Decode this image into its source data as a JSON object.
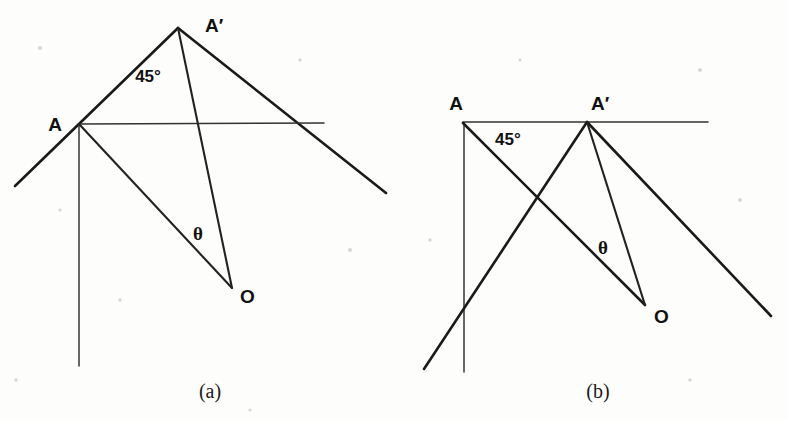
{
  "figure": {
    "background_color": "#fdfdfb",
    "ink_color": "#1a1a1a",
    "width": 788,
    "height": 421
  },
  "panels": [
    {
      "id": "panel-a",
      "caption": "(a)",
      "caption_pos": {
        "x": 210,
        "y": 398
      },
      "labels": {
        "vertex_a": "A",
        "vertex_a_prime": "A′",
        "vertex_o": "O",
        "angle_45": "45°",
        "angle_theta": "θ"
      },
      "label_positions": {
        "vertex_a": {
          "x": 55,
          "y": 131
        },
        "vertex_a_prime": {
          "x": 205,
          "y": 32
        },
        "vertex_o": {
          "x": 240,
          "y": 303
        },
        "angle_45": {
          "x": 148,
          "y": 82
        },
        "angle_theta": {
          "x": 198,
          "y": 240
        }
      },
      "points": {
        "A": {
          "x": 79,
          "y": 124
        },
        "A_prime": {
          "x": 178,
          "y": 28
        },
        "O": {
          "x": 232,
          "y": 288
        }
      },
      "segments": [
        {
          "name": "mirror-left-ray",
          "x1": 15,
          "y1": 186,
          "x2": 178,
          "y2": 28,
          "weight": "thick"
        },
        {
          "name": "mirror-right-ray",
          "x1": 178,
          "y1": 28,
          "x2": 386,
          "y2": 193,
          "weight": "thick"
        },
        {
          "name": "horizontal-axis",
          "x1": 79,
          "y1": 124,
          "x2": 324,
          "y2": 123,
          "weight": "thin"
        },
        {
          "name": "vertical-axis",
          "x1": 79,
          "y1": 124,
          "x2": 79,
          "y2": 366,
          "weight": "thin"
        },
        {
          "name": "ray-A-to-O",
          "x1": 79,
          "y1": 124,
          "x2": 232,
          "y2": 288,
          "weight": "med"
        },
        {
          "name": "ray-Aprime-to-O",
          "x1": 178,
          "y1": 28,
          "x2": 232,
          "y2": 288,
          "weight": "med"
        }
      ]
    },
    {
      "id": "panel-b",
      "caption": "(b)",
      "caption_pos": {
        "x": 598,
        "y": 398
      },
      "labels": {
        "vertex_a": "A",
        "vertex_a_prime": "A′",
        "vertex_o": "O",
        "angle_45": "45°",
        "angle_theta": "θ"
      },
      "label_positions": {
        "vertex_a": {
          "x": 456,
          "y": 110
        },
        "vertex_a_prime": {
          "x": 591,
          "y": 110
        },
        "vertex_o": {
          "x": 654,
          "y": 323
        },
        "angle_45": {
          "x": 495,
          "y": 145
        },
        "angle_theta": {
          "x": 603,
          "y": 254
        }
      },
      "points": {
        "A": {
          "x": 463,
          "y": 123
        },
        "A_prime": {
          "x": 587,
          "y": 122
        },
        "O": {
          "x": 645,
          "y": 305
        }
      },
      "segments": [
        {
          "name": "horizontal-axis",
          "x1": 463,
          "y1": 122,
          "x2": 708,
          "y2": 122,
          "weight": "thin"
        },
        {
          "name": "vertical-axis",
          "x1": 464,
          "y1": 123,
          "x2": 464,
          "y2": 372,
          "weight": "thin"
        },
        {
          "name": "ray-A-to-O",
          "x1": 463,
          "y1": 123,
          "x2": 645,
          "y2": 305,
          "weight": "thick"
        },
        {
          "name": "mirror-left-ray",
          "x1": 424,
          "y1": 369,
          "x2": 587,
          "y2": 122,
          "weight": "thick"
        },
        {
          "name": "mirror-right-ray",
          "x1": 587,
          "y1": 122,
          "x2": 771,
          "y2": 316,
          "weight": "thick"
        },
        {
          "name": "ray-Aprime-to-O",
          "x1": 587,
          "y1": 122,
          "x2": 645,
          "y2": 305,
          "weight": "med"
        }
      ]
    }
  ]
}
